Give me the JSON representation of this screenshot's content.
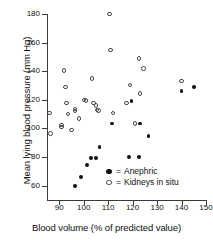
{
  "chart_data": {
    "type": "scatter",
    "title": "",
    "xlabel": "Blood volume (% of predicted value)",
    "ylabel": "Mean lying blood pressure (mm Hg)",
    "xlim": [
      85,
      150
    ],
    "ylim": [
      50,
      180
    ],
    "xticks": [
      90,
      100,
      110,
      120,
      130,
      140,
      150
    ],
    "yticks": [
      60,
      80,
      100,
      120,
      140,
      160,
      180
    ],
    "grid": false,
    "legend_position": "lower-right-inside",
    "series": [
      {
        "name": "Anephric",
        "marker": "filled-circle",
        "color": "#111111",
        "points": [
          [
            96.5,
            60.0
          ],
          [
            99.0,
            66.0
          ],
          [
            101.5,
            74.5
          ],
          [
            103.0,
            79.5
          ],
          [
            105.0,
            79.5
          ],
          [
            106.5,
            87.0
          ],
          [
            111.5,
            103.5
          ],
          [
            118.5,
            80.0
          ],
          [
            119.5,
            119.0
          ],
          [
            122.5,
            80.0
          ],
          [
            123.0,
            103.5
          ],
          [
            126.5,
            94.5
          ],
          [
            140.0,
            126.0
          ],
          [
            145.0,
            129.0
          ]
        ]
      },
      {
        "name": "Kidneys in situ",
        "marker": "open-circle",
        "color": "#4a4a4a",
        "points": [
          [
            86.0,
            111.0
          ],
          [
            86.5,
            96.5
          ],
          [
            91.0,
            102.5
          ],
          [
            91.0,
            101.0
          ],
          [
            92.0,
            140.5
          ],
          [
            92.5,
            129.0
          ],
          [
            93.0,
            118.0
          ],
          [
            93.5,
            110.0
          ],
          [
            95.0,
            99.0
          ],
          [
            96.5,
            113.5
          ],
          [
            96.5,
            112.0
          ],
          [
            98.0,
            107.0
          ],
          [
            100.0,
            120.0
          ],
          [
            101.0,
            119.5
          ],
          [
            103.5,
            135.0
          ],
          [
            104.0,
            118.0
          ],
          [
            105.0,
            116.0
          ],
          [
            105.5,
            113.0
          ],
          [
            106.0,
            112.5
          ],
          [
            110.5,
            180.0
          ],
          [
            111.0,
            155.0
          ],
          [
            112.0,
            111.0
          ],
          [
            117.5,
            118.0
          ],
          [
            119.0,
            130.5
          ],
          [
            121.0,
            103.5
          ],
          [
            122.5,
            149.0
          ],
          [
            123.0,
            124.5
          ],
          [
            124.5,
            142.0
          ],
          [
            140.0,
            133.0
          ]
        ]
      }
    ]
  },
  "legend": {
    "equals": "=",
    "items": [
      {
        "label": "Anephric",
        "marker": "filled-circle"
      },
      {
        "label": "Kidneys in situ",
        "marker": "open-circle"
      }
    ]
  }
}
